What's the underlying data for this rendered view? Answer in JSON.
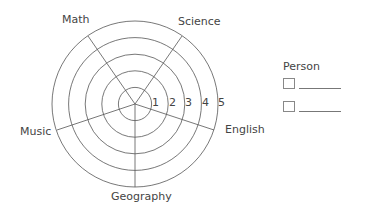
{
  "diagram": {
    "type": "radar-wheel-template",
    "rings": 5,
    "scale_labels": [
      "1",
      "2",
      "3",
      "4",
      "5"
    ],
    "axes": [
      {
        "label": "Science"
      },
      {
        "label": "English"
      },
      {
        "label": "Geography"
      },
      {
        "label": "Music"
      },
      {
        "label": "Math"
      }
    ]
  },
  "legend": {
    "title": "Person",
    "entries": [
      {
        "swatch": "",
        "name": ""
      },
      {
        "swatch": "",
        "name": ""
      }
    ]
  },
  "colors": {
    "line": "#555555",
    "text": "#444444",
    "background": "#ffffff"
  }
}
